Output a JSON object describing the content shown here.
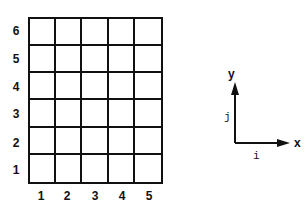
{
  "diagram": {
    "grid": {
      "columns": 5,
      "rows": 6,
      "column_labels": [
        "1",
        "2",
        "3",
        "4",
        "5"
      ],
      "row_labels_top_to_bottom": [
        "6",
        "5",
        "4",
        "3",
        "2",
        "1"
      ]
    },
    "axes": {
      "y_label": "y",
      "x_label": "x",
      "j_label": "j",
      "i_label": "i"
    },
    "colors": {
      "line": "#111111",
      "background": "#ffffff"
    }
  }
}
